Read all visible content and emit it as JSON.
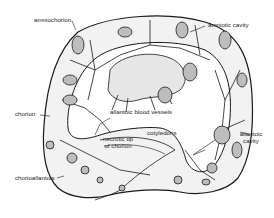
{
  "diagram": {
    "type": "anatomical illustration",
    "labels": {
      "amniochorion": "amniochorion",
      "amniotic_cavity": "amniotic cavity",
      "chorion": "chorion",
      "allantoic_blood_vessels": "allantoic blood vessels",
      "necrotic_tip_line1": "necrotic tip",
      "necrotic_tip_line2": "of chorion",
      "cotyledons": "cotyledons",
      "allantoic_cavity_line1": "allantoic",
      "allantoic_cavity_line2": "cavity",
      "chorioallantois": "chorioallantois"
    },
    "colors": {
      "ink": "#1a1a1a",
      "fill": "#f1f1f1",
      "background": "#ffffff"
    }
  }
}
